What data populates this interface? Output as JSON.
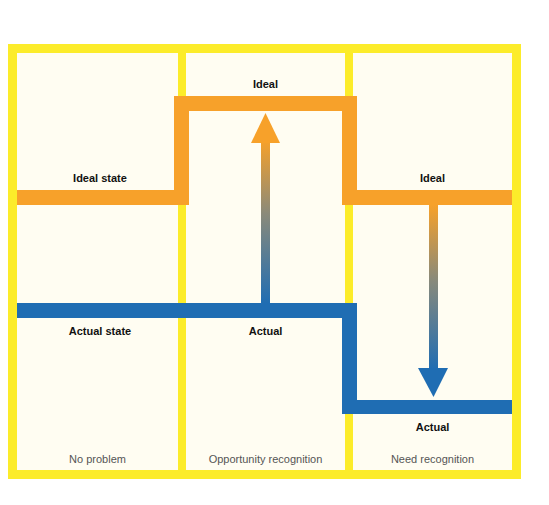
{
  "colors": {
    "frame": "#fcec2a",
    "background": "#fffdf2",
    "ideal": "#f7a12a",
    "actual": "#1f6db3"
  },
  "columns": [
    {
      "caption": "No problem",
      "ideal_label": "Ideal state",
      "actual_label": "Actual state"
    },
    {
      "caption": "Opportunity recognition",
      "ideal_label": "Ideal",
      "actual_label": "Actual",
      "arrow": "up"
    },
    {
      "caption": "Need recognition",
      "ideal_label": "Ideal",
      "actual_label": "Actual",
      "arrow": "down"
    }
  ]
}
